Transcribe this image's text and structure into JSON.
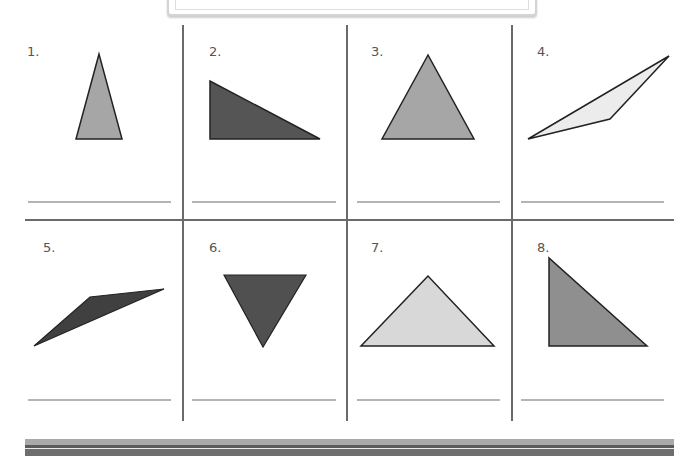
{
  "worksheet": {
    "title_box": "",
    "problems": [
      {
        "label": "1.",
        "shape": "acute-isosceles-triangle",
        "fill": "#a6a6a6",
        "points": "99,54 76,139 122,139",
        "label_pos": [
          27,
          45
        ]
      },
      {
        "label": "2.",
        "shape": "right-triangle",
        "fill": "#555555",
        "points": "210,81 210,139 320,139",
        "label_pos": [
          209,
          45
        ]
      },
      {
        "label": "3.",
        "shape": "equilateral-triangle",
        "fill": "#a6a6a6",
        "points": "428,55 382,139 474,139",
        "label_pos": [
          371,
          45
        ]
      },
      {
        "label": "4.",
        "shape": "obtuse-scalene-triangle",
        "fill": "#ececec",
        "points": "528,139 610,119 669,56",
        "label_pos": [
          537,
          45
        ]
      },
      {
        "label": "5.",
        "shape": "obtuse-scalene-triangle",
        "fill": "#404040",
        "points": "34,346 90,297 164,289",
        "label_pos": [
          43,
          241
        ]
      },
      {
        "label": "6.",
        "shape": "inverted-equilateral-triangle",
        "fill": "#505050",
        "points": "224,275 306,275 263,347",
        "label_pos": [
          209,
          241
        ]
      },
      {
        "label": "7.",
        "shape": "obtuse-isosceles-triangle",
        "fill": "#d8d8d8",
        "points": "428,276 361,346 494,346",
        "label_pos": [
          371,
          241
        ]
      },
      {
        "label": "8.",
        "shape": "right-isosceles-triangle",
        "fill": "#8f8f8f",
        "points": "549,258 549,346 647,346",
        "label_pos": [
          537,
          241
        ]
      }
    ],
    "answer_lines": [
      {
        "x1": 28,
        "x2": 171,
        "y": 202
      },
      {
        "x1": 192,
        "x2": 336,
        "y": 202
      },
      {
        "x1": 357,
        "x2": 500,
        "y": 202
      },
      {
        "x1": 521,
        "x2": 664,
        "y": 202
      },
      {
        "x1": 28,
        "x2": 171,
        "y": 400
      },
      {
        "x1": 192,
        "x2": 336,
        "y": 400
      },
      {
        "x1": 357,
        "x2": 500,
        "y": 400
      },
      {
        "x1": 521,
        "x2": 664,
        "y": 400
      }
    ],
    "grid": {
      "vertical_x": [
        183,
        347,
        512
      ],
      "vertical_y": [
        25,
        421
      ],
      "horizontal_y": 220,
      "horizontal_x": [
        25,
        674
      ],
      "line_color": "#6a6a6a"
    },
    "bottom_bar_colors": {
      "light": "#a9a9a9",
      "dark": "#5a5a5a",
      "gap": "#e8e8e8",
      "lower": "#6e6e6e"
    }
  }
}
